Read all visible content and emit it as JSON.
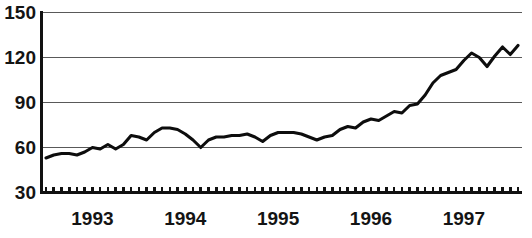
{
  "chart_data": {
    "type": "line",
    "title": "",
    "subtitle": "",
    "xlabel": "",
    "ylabel": "",
    "grid": true,
    "legend": false,
    "legend_position": "none",
    "line_color": "#0d0d0d",
    "axis_color": "#111111",
    "grid_color": "#595959",
    "text_color": "#141414",
    "ylim": [
      30,
      150
    ],
    "yticks": [
      30,
      60,
      90,
      120,
      150
    ],
    "ytick_labels": [
      "30",
      "60",
      "90",
      "120",
      "150"
    ],
    "xtick_labels": [
      "1993",
      "1994",
      "1995",
      "1996",
      "1997"
    ],
    "xtick_positions": [
      6,
      18,
      30,
      42,
      54
    ],
    "x_minor_tick_count": 62,
    "x_minor_tick_note": "monthly tick marks along the bottom axis",
    "x": [
      0,
      1,
      2,
      3,
      4,
      5,
      6,
      7,
      8,
      9,
      10,
      11,
      12,
      13,
      14,
      15,
      16,
      17,
      18,
      19,
      20,
      21,
      22,
      23,
      24,
      25,
      26,
      27,
      28,
      29,
      30,
      31,
      32,
      33,
      34,
      35,
      36,
      37,
      38,
      39,
      40,
      41,
      42,
      43,
      44,
      45,
      46,
      47,
      48,
      49,
      50,
      51,
      52,
      53,
      54,
      55,
      56,
      57,
      58,
      59,
      60,
      61
    ],
    "series": [
      {
        "name": "index",
        "values": [
          53,
          55,
          56,
          56,
          55,
          57,
          60,
          59,
          62,
          59,
          62,
          68,
          67,
          65,
          70,
          73,
          73,
          72,
          69,
          65,
          60,
          65,
          67,
          67,
          68,
          68,
          69,
          67,
          64,
          68,
          70,
          70,
          70,
          69,
          67,
          65,
          67,
          68,
          72,
          74,
          73,
          77,
          79,
          78,
          81,
          84,
          83,
          88,
          89,
          95,
          103,
          108,
          110,
          112,
          118,
          123,
          120,
          114,
          121,
          127,
          122,
          128
        ]
      }
    ]
  }
}
